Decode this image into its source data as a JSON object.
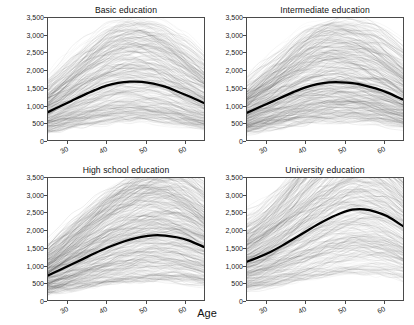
{
  "chart_data": {
    "type": "line",
    "title": "",
    "xlabel": "Age",
    "ylabel": "Income (monthly, net)",
    "xlim": [
      25,
      65
    ],
    "ylim": [
      0,
      3500
    ],
    "xticks": [
      30,
      40,
      50,
      60
    ],
    "xtick_labels": [
      "30",
      "40",
      "50",
      "60"
    ],
    "yticks": [
      0,
      500,
      1000,
      1500,
      2000,
      2500,
      3000,
      3500
    ],
    "ytick_labels": [
      "0",
      "500",
      "1,000",
      "1,500",
      "2,000",
      "2,500",
      "3,000",
      "3,500"
    ],
    "grid": false,
    "legend": "none",
    "layout": "2x2 facet grid",
    "x": [
      25,
      28,
      31,
      34,
      37,
      40,
      43,
      46,
      49,
      52,
      55,
      58,
      61,
      65
    ],
    "panels": [
      {
        "title": "Basic education",
        "series": [
          {
            "name": "Mean income",
            "color": "#000000",
            "values": [
              800,
              960,
              1120,
              1280,
              1430,
              1560,
              1640,
              1675,
              1670,
              1620,
              1530,
              1400,
              1260,
              1060
            ]
          }
        ],
        "individual_trajectories": {
          "name": "Individual income trajectories",
          "color": "#3a3a3a",
          "count": 320,
          "description": "light grey spaghetti lines of individual observed income paths"
        }
      },
      {
        "title": "Intermediate education",
        "series": [
          {
            "name": "Mean income",
            "color": "#000000",
            "values": [
              780,
              930,
              1080,
              1230,
              1380,
              1510,
              1600,
              1650,
              1655,
              1630,
              1570,
              1480,
              1360,
              1160
            ]
          }
        ],
        "individual_trajectories": {
          "name": "Individual income trajectories",
          "color": "#3a3a3a",
          "count": 380,
          "description": "light grey spaghetti lines of individual observed income paths"
        }
      },
      {
        "title": "High school education",
        "series": [
          {
            "name": "Mean income",
            "color": "#000000",
            "values": [
              700,
              860,
              1020,
              1180,
              1340,
              1490,
              1620,
              1730,
              1810,
              1855,
              1850,
              1800,
              1710,
              1520
            ]
          }
        ],
        "individual_trajectories": {
          "name": "Individual income trajectories",
          "color": "#3a3a3a",
          "count": 420,
          "description": "light grey spaghetti lines of individual observed income paths"
        }
      },
      {
        "title": "University education",
        "series": [
          {
            "name": "Mean income",
            "color": "#000000",
            "values": [
              1100,
              1230,
              1380,
              1560,
              1760,
              1960,
              2160,
              2340,
              2490,
              2590,
              2600,
              2530,
              2400,
              2120
            ]
          }
        ],
        "individual_trajectories": {
          "name": "Individual income trajectories",
          "color": "#3a3a3a",
          "count": 400,
          "description": "light grey spaghetti lines of individual observed income paths"
        }
      }
    ]
  },
  "axis": {
    "x_title": "Age",
    "y_title": "Income (monthly, net)"
  }
}
